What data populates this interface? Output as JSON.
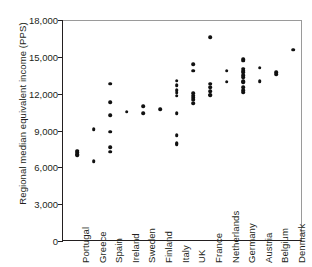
{
  "chart_data": {
    "type": "scatter",
    "title": "",
    "xlabel": "",
    "ylabel": "Regional median equivalent income (PPS)",
    "ylim": [
      0,
      18000
    ],
    "yticks": [
      0,
      3000,
      6000,
      9000,
      12000,
      15000,
      18000
    ],
    "ytick_labels": [
      "0",
      "3,000",
      "6,000",
      "9,000",
      "12,000",
      "15,000",
      "18,000"
    ],
    "grid": false,
    "legend": "none",
    "categories": [
      "Portugal",
      "Greece",
      "Spain",
      "Ireland",
      "Sweden",
      "Finland",
      "Italy",
      "UK",
      "France",
      "Netherlands",
      "Germany",
      "Austria",
      "Belgium",
      "Denmark"
    ],
    "series": [
      {
        "name": "Regional median equivalent income",
        "groups": [
          {
            "category": "Portugal",
            "values": [
              7450,
              7300,
              7150,
              7050
            ]
          },
          {
            "category": "Greece",
            "values": [
              9200,
              6600
            ]
          },
          {
            "category": "Spain",
            "values": [
              12900,
              11400,
              10350,
              9000,
              7700,
              7350
            ]
          },
          {
            "category": "Ireland",
            "values": [
              10600
            ]
          },
          {
            "category": "Sweden",
            "values": [
              11050,
              10500
            ]
          },
          {
            "category": "Finland",
            "values": [
              10800
            ]
          },
          {
            "category": "Italy",
            "values": [
              13150,
              12750,
              12350,
              12150,
              11900,
              10500,
              8700,
              8050,
              7950
            ]
          },
          {
            "category": "UK",
            "values": [
              14500,
              13950,
              12100,
              11900,
              11750,
              11600,
              11300
            ]
          },
          {
            "category": "France",
            "values": [
              16700,
              12900,
              12600,
              12300,
              12000,
              11950
            ]
          },
          {
            "category": "Netherlands",
            "values": [
              13950,
              13050
            ]
          },
          {
            "category": "Germany",
            "values": [
              14900,
              14750,
              14100,
              13850,
              13600,
              13400,
              13100,
              12600,
              12350,
              12200,
              13950,
              13000
            ]
          },
          {
            "category": "Austria",
            "values": [
              14200,
              13100
            ]
          },
          {
            "category": "Belgium",
            "values": [
              13850,
              13650
            ]
          },
          {
            "category": "Denmark",
            "values": [
              15650
            ]
          }
        ]
      }
    ],
    "marker": {
      "shape": "circle",
      "color": "#111111",
      "size": 3.6
    },
    "axis_color": "#231f20"
  }
}
